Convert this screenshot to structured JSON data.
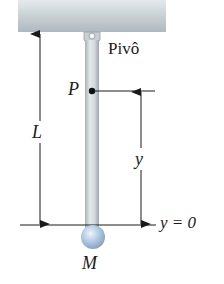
{
  "diagram": {
    "labels": {
      "pivot": "Pivô",
      "point": "P",
      "length": "L",
      "height": "y",
      "baseline": "y = 0",
      "mass": "M"
    },
    "colors": {
      "ceiling": "#b9c3c8",
      "rod": "#cfd3d6",
      "ball": "#a9c2de",
      "lines": "#1a1a1a"
    }
  }
}
